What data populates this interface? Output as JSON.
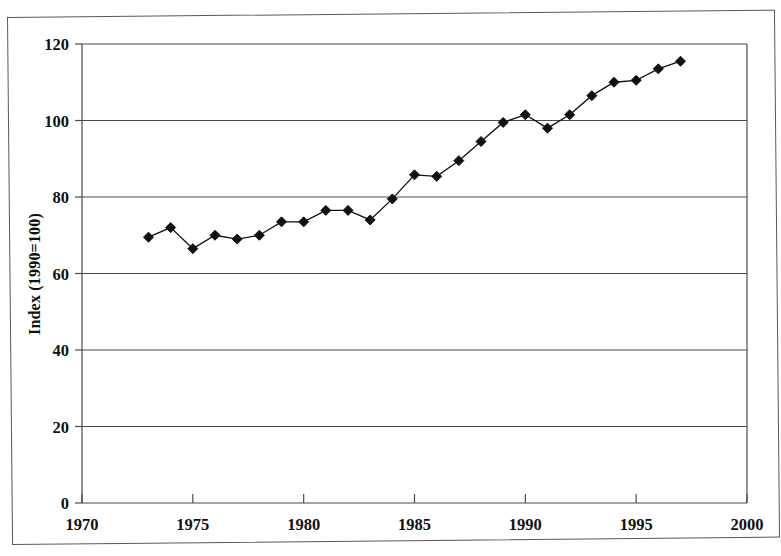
{
  "figure": {
    "background_color": "#ffffff",
    "frame_color": "#5a5a5a",
    "axis_color": "#4a4a4a",
    "series_color": "#111111"
  },
  "chart_data": {
    "type": "line",
    "title": "",
    "subtitle": "",
    "xlabel": "",
    "ylabel": "Index (1990=100)",
    "xlim": [
      1970,
      2000
    ],
    "ylim": [
      0,
      120
    ],
    "xticks": [
      1970,
      1975,
      1980,
      1985,
      1990,
      1995,
      2000
    ],
    "xticklabels": [
      "1970",
      "1975",
      "1980",
      "1985",
      "1990",
      "1995",
      "2000"
    ],
    "yticks": [
      0,
      20,
      40,
      60,
      80,
      100,
      120
    ],
    "yticklabels": [
      "0",
      "20",
      "40",
      "60",
      "80",
      "100",
      "120"
    ],
    "grid": "horizontal",
    "legend": "none",
    "marker": "diamond",
    "series": [
      {
        "name": "Index (1990=100)",
        "x": [
          1973,
          1974,
          1975,
          1976,
          1977,
          1978,
          1979,
          1980,
          1981,
          1982,
          1983,
          1984,
          1985,
          1986,
          1987,
          1988,
          1989,
          1990,
          1991,
          1992,
          1993,
          1994,
          1995,
          1996,
          1997
        ],
        "values": [
          69.5,
          72.0,
          66.5,
          70.0,
          69.0,
          70.0,
          73.5,
          73.5,
          76.5,
          76.5,
          74.0,
          79.5,
          85.8,
          85.4,
          89.5,
          94.5,
          99.5,
          101.5,
          98.0,
          101.5,
          106.5,
          110.0,
          110.5,
          113.5,
          115.5
        ]
      }
    ]
  }
}
